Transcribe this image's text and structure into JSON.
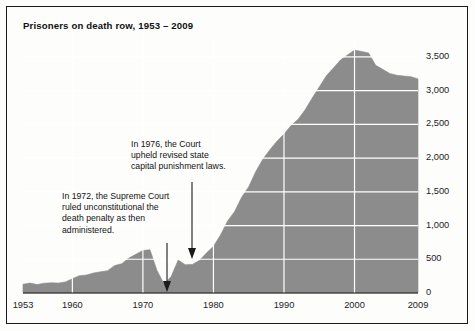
{
  "figure": {
    "title": "Prisoners on death row, 1953 – 2009",
    "frame_color": "#1a1a1a",
    "area_fill": "#8c8c8c",
    "grid_color": "#ffffff",
    "background": "#fdfdfc"
  },
  "annotations": {
    "a1972": {
      "text": "In 1972, the Supreme Court\nruled unconstitutional the\ndeath penalty as then\nadministered.",
      "year": 1972
    },
    "a1976": {
      "text": "In 1976, the Court\nupheld revised state\ncapital punishment laws.",
      "year": 1976
    }
  },
  "chart_data": {
    "type": "area",
    "title": "Prisoners on death row, 1953 – 2009",
    "xlabel": "",
    "ylabel": "",
    "xlim": [
      1953,
      2009
    ],
    "ylim": [
      0,
      3750
    ],
    "grid": true,
    "legend": false,
    "xticks": [
      "1953",
      "1960",
      "1970",
      "1980",
      "1990",
      "2000",
      "2009"
    ],
    "xtick_values": [
      1953,
      1960,
      1970,
      1980,
      1990,
      2000,
      2009
    ],
    "yticks": [
      "0",
      "500",
      "1,000",
      "1,500",
      "2,000",
      "2,500",
      "3,000",
      "3,500"
    ],
    "ytick_values": [
      0,
      500,
      1000,
      1500,
      2000,
      2500,
      3000,
      3500
    ],
    "x": [
      1953,
      1954,
      1955,
      1956,
      1957,
      1958,
      1959,
      1960,
      1961,
      1962,
      1963,
      1964,
      1965,
      1966,
      1967,
      1968,
      1969,
      1970,
      1971,
      1972,
      1973,
      1974,
      1975,
      1976,
      1977,
      1978,
      1979,
      1980,
      1981,
      1982,
      1983,
      1984,
      1985,
      1986,
      1987,
      1988,
      1989,
      1990,
      1991,
      1992,
      1993,
      1994,
      1995,
      1996,
      1997,
      1998,
      1999,
      2000,
      2001,
      2002,
      2003,
      2004,
      2005,
      2006,
      2007,
      2008,
      2009
    ],
    "values": [
      131,
      147,
      125,
      146,
      151,
      147,
      164,
      212,
      257,
      267,
      297,
      315,
      331,
      406,
      435,
      517,
      575,
      631,
      642,
      334,
      134,
      244,
      488,
      420,
      423,
      482,
      593,
      692,
      860,
      1066,
      1209,
      1420,
      1575,
      1800,
      1984,
      2124,
      2250,
      2356,
      2482,
      2575,
      2716,
      2890,
      3054,
      3219,
      3335,
      3452,
      3527,
      3601,
      3581,
      3557,
      3374,
      3315,
      3254,
      3228,
      3215,
      3207,
      3173
    ],
    "series": [
      {
        "name": "Prisoners on death row",
        "values": [
          131,
          147,
          125,
          146,
          151,
          147,
          164,
          212,
          257,
          267,
          297,
          315,
          331,
          406,
          435,
          517,
          575,
          631,
          642,
          334,
          134,
          244,
          488,
          420,
          423,
          482,
          593,
          692,
          860,
          1066,
          1209,
          1420,
          1575,
          1800,
          1984,
          2124,
          2250,
          2356,
          2482,
          2575,
          2716,
          2890,
          3054,
          3219,
          3335,
          3452,
          3527,
          3601,
          3581,
          3557,
          3374,
          3315,
          3254,
          3228,
          3215,
          3207,
          3173
        ]
      }
    ]
  }
}
